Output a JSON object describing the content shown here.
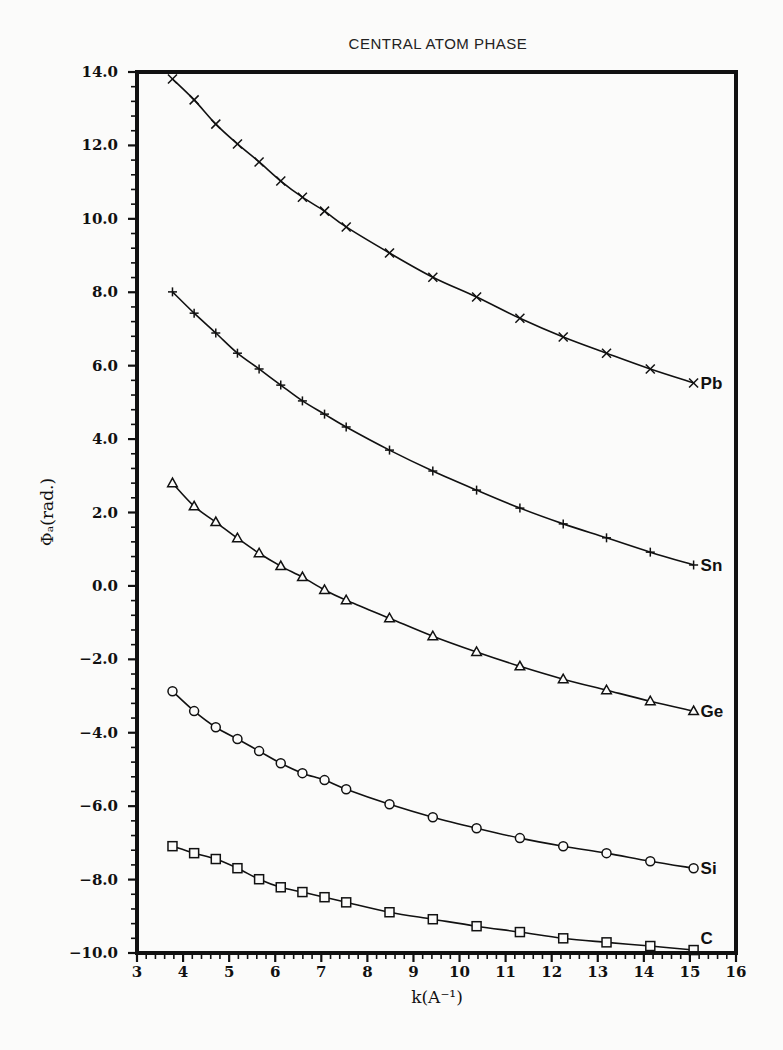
{
  "chart_data": {
    "type": "line",
    "title": "CENTRAL ATOM PHASE",
    "xlabel": "k(A⁻¹)",
    "ylabel": "Φₐ(rad.)",
    "xlim": [
      3,
      16
    ],
    "ylim": [
      -10.0,
      14.0
    ],
    "xticks": [
      3,
      4,
      5,
      6,
      7,
      8,
      9,
      10,
      11,
      12,
      13,
      14,
      15,
      16
    ],
    "yticks": [
      -10.0,
      -8.0,
      -6.0,
      -4.0,
      -2.0,
      0.0,
      2.0,
      4.0,
      6.0,
      8.0,
      10.0,
      12.0,
      14.0
    ],
    "ytick_labels": [
      "-10.0",
      "-8.0",
      "-6.0",
      "-4.0",
      "-2.0",
      "0.0",
      "2.0",
      "4.0",
      "6.0",
      "8.0",
      "10.0",
      "12.0",
      "14.0"
    ],
    "grid": false,
    "legend_position": "inline labels at right end of each curve",
    "x": [
      3.77,
      4.24,
      4.71,
      5.18,
      5.65,
      6.12,
      6.59,
      7.07,
      7.54,
      8.48,
      9.42,
      10.37,
      11.31,
      12.25,
      13.19,
      14.14,
      15.08
    ],
    "series": [
      {
        "name": "Pb",
        "marker": "x",
        "values": [
          13.81,
          13.24,
          12.58,
          12.04,
          11.55,
          11.03,
          10.59,
          10.21,
          9.78,
          9.07,
          8.41,
          7.87,
          7.29,
          6.78,
          6.34,
          5.91,
          5.53
        ]
      },
      {
        "name": "Sn",
        "marker": "+",
        "values": [
          8.01,
          7.43,
          6.89,
          6.34,
          5.91,
          5.47,
          5.04,
          4.68,
          4.33,
          3.7,
          3.13,
          2.61,
          2.12,
          1.69,
          1.31,
          0.92,
          0.57
        ]
      },
      {
        "name": "Ge",
        "marker": "triangle",
        "values": [
          2.8,
          2.17,
          1.74,
          1.3,
          0.89,
          0.54,
          0.24,
          -0.11,
          -0.39,
          -0.88,
          -1.37,
          -1.8,
          -2.19,
          -2.54,
          -2.84,
          -3.14,
          -3.41
        ]
      },
      {
        "name": "Si",
        "marker": "circle",
        "values": [
          -2.87,
          -3.41,
          -3.85,
          -4.17,
          -4.5,
          -4.83,
          -5.1,
          -5.29,
          -5.54,
          -5.95,
          -6.3,
          -6.6,
          -6.87,
          -7.09,
          -7.28,
          -7.5,
          -7.69
        ]
      },
      {
        "name": "C",
        "marker": "square",
        "values": [
          -7.09,
          -7.28,
          -7.44,
          -7.69,
          -7.99,
          -8.21,
          -8.34,
          -8.48,
          -8.62,
          -8.89,
          -9.08,
          -9.27,
          -9.43,
          -9.6,
          -9.71,
          -9.81,
          -9.92
        ]
      }
    ]
  }
}
